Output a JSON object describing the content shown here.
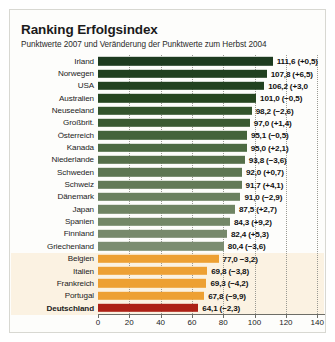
{
  "header": {
    "title": "Ranking Erfolgsindex",
    "subtitle": "Punktwerte 2007 und Veränderung der Punktwerte zum Herbst 2004"
  },
  "chart_data": {
    "type": "bar",
    "title": "Ranking Erfolgsindex",
    "subtitle": "Punktwerte 2007 und Veränderung der Punktwerte zum Herbst 2004",
    "orientation": "horizontal",
    "xlabel": "",
    "ylabel": "",
    "xlim": [
      0,
      145
    ],
    "ticks": [
      0,
      20,
      40,
      60,
      80,
      100,
      120,
      140
    ],
    "grid": true,
    "legend": null,
    "categories": [
      "Irland",
      "Norwegen",
      "USA",
      "Australien",
      "Neuseeland",
      "Großbrit.",
      "Österreich",
      "Kanada",
      "Niederlande",
      "Schweden",
      "Schweiz",
      "Dänemark",
      "Japan",
      "Spanien",
      "Finnland",
      "Griechenland",
      "Belgien",
      "Italien",
      "Frankreich",
      "Portugal",
      "Deutschland"
    ],
    "values": [
      111.6,
      107.8,
      106.2,
      101.0,
      98.2,
      97.0,
      95.1,
      95.0,
      93.8,
      92.0,
      91.7,
      91.0,
      87.5,
      84.3,
      82.4,
      80.4,
      77.0,
      69.8,
      69.3,
      67.8,
      64.1
    ],
    "changes": [
      0.5,
      6.5,
      3.0,
      -0.5,
      -2.6,
      1.4,
      -0.5,
      2.1,
      -3.6,
      0.7,
      4.1,
      -2.9,
      2.7,
      9.2,
      5.3,
      -3.6,
      -3.2,
      -3.8,
      -4.2,
      -9.9,
      -2.3
    ],
    "rows": [
      {
        "label": "Irland",
        "value": 111.6,
        "value_text": "111,6 (+0,5)",
        "color": "#1d3b1f",
        "bold": false
      },
      {
        "label": "Norwegen",
        "value": 107.8,
        "value_text": "107,8 (+6,5)",
        "color": "#20401f",
        "bold": false
      },
      {
        "label": "USA",
        "value": 106.2,
        "value_text": "106,2 (+3,0",
        "color": "#22421f",
        "bold": false
      },
      {
        "label": "Australien",
        "value": 101.0,
        "value_text": "101,0 (−0,5)",
        "color": "#264620",
        "bold": false
      },
      {
        "label": "Neuseeland",
        "value": 98.2,
        "value_text": "98,2 (−2,6)",
        "color": "#33542c",
        "bold": false
      },
      {
        "label": "Großbrit.",
        "value": 97.0,
        "value_text": "97,0 (+1,4)",
        "color": "#3a5a32",
        "bold": false
      },
      {
        "label": "Österreich",
        "value": 95.1,
        "value_text": "95,1 (−0,5)",
        "color": "#44633b",
        "bold": false
      },
      {
        "label": "Kanada",
        "value": 95.0,
        "value_text": "95,0 (+2,1)",
        "color": "#4c6a42",
        "bold": false
      },
      {
        "label": "Niederlande",
        "value": 93.8,
        "value_text": "93,8 (−3,6)",
        "color": "#556f4a",
        "bold": false
      },
      {
        "label": "Schweden",
        "value": 92.0,
        "value_text": "92,0 (+0,7)",
        "color": "#5d7652",
        "bold": false
      },
      {
        "label": "Schweiz",
        "value": 91.7,
        "value_text": "91,7 (+4,1)",
        "color": "#637a58",
        "bold": false
      },
      {
        "label": "Dänemark",
        "value": 91.0,
        "value_text": "91,0 (−2,9)",
        "color": "#6a805f",
        "bold": false
      },
      {
        "label": "Japan",
        "value": 87.5,
        "value_text": "87,5 (+2,7)",
        "color": "#6f8463",
        "bold": false
      },
      {
        "label": "Spanien",
        "value": 84.3,
        "value_text": "84,3 (+9,2)",
        "color": "#738767",
        "bold": false
      },
      {
        "label": "Finnland",
        "value": 82.4,
        "value_text": "82,4 (+5,3)",
        "color": "#77896b",
        "bold": false
      },
      {
        "label": "Griechenland",
        "value": 80.4,
        "value_text": "80,4 (−3,6)",
        "color": "#7b8d70",
        "bold": false
      },
      {
        "label": "Belgien",
        "value": 77.0,
        "value_text": "77,0 −3,2)",
        "color": "#eda033",
        "bold": false
      },
      {
        "label": "Italien",
        "value": 69.8,
        "value_text": "69,8 (−3,8)",
        "color": "#eda033",
        "bold": false
      },
      {
        "label": "Frankreich",
        "value": 69.3,
        "value_text": "69,3 (−4,2)",
        "color": "#eda033",
        "bold": false
      },
      {
        "label": "Portugal",
        "value": 67.8,
        "value_text": "67,8 (−9,9)",
        "color": "#eda033",
        "bold": false
      },
      {
        "label": "Deutschland",
        "value": 64.1,
        "value_text": "64,1 (−2,3)",
        "color": "#ad2116",
        "bold": true
      }
    ]
  },
  "colors": {
    "green_dark": "#1d3b1f",
    "green_light": "#7b8d70",
    "orange": "#eda033",
    "red": "#ad2116",
    "band": "#fbf2e2",
    "frame": "#d8d8d2"
  }
}
